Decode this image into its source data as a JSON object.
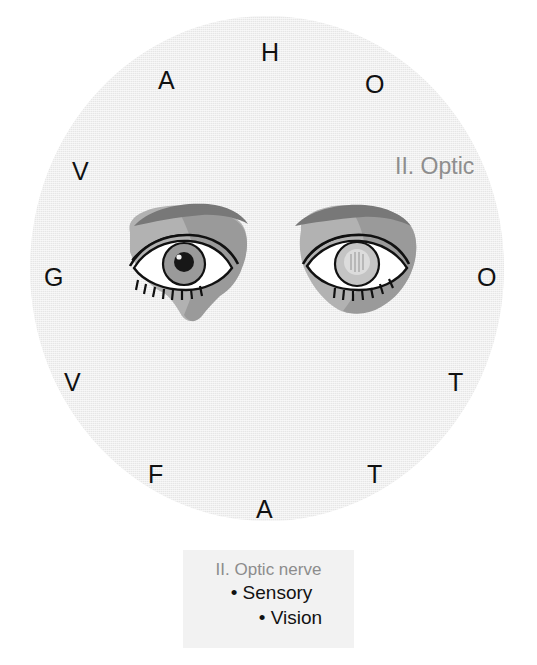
{
  "figure": {
    "nerve_label": "II. Optic",
    "field_color": "#ededed",
    "ring_letters": [
      {
        "char": "H",
        "x": 261,
        "y": 40
      },
      {
        "char": "A",
        "x": 158,
        "y": 68
      },
      {
        "char": "O",
        "x": 365,
        "y": 72
      },
      {
        "char": "V",
        "x": 72,
        "y": 159
      },
      {
        "char": "G",
        "x": 44,
        "y": 265
      },
      {
        "char": "O",
        "x": 477,
        "y": 265
      },
      {
        "char": "V",
        "x": 64,
        "y": 370
      },
      {
        "char": "T",
        "x": 448,
        "y": 370
      },
      {
        "char": "F",
        "x": 148,
        "y": 462
      },
      {
        "char": "T",
        "x": 367,
        "y": 462
      },
      {
        "char": "A",
        "x": 256,
        "y": 497
      }
    ],
    "optic_label_pos": {
      "x": 395,
      "y": 155
    },
    "eyes": [
      {
        "side": "left",
        "x": 116,
        "y": 196,
        "pupil": "dark",
        "pupil_color": "#171717",
        "iris_color": "#9a9a9a"
      },
      {
        "side": "right",
        "x": 285,
        "y": 196,
        "pupil": "pale",
        "pupil_color": "#d8d8d8",
        "iris_color": "#c0c0c0"
      }
    ],
    "skin_tone_light": "#b4b4b4",
    "skin_tone_mid": "#a0a0a0",
    "brow_tone": "#7c7c7c",
    "shadow_tone": "#8e8e8e"
  },
  "caption": {
    "title": "II. Optic nerve",
    "bullets": [
      "• Sensory",
      "• Vision"
    ],
    "background": "#f2f2f2"
  }
}
